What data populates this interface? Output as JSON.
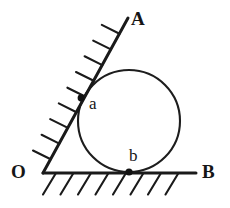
{
  "figure": {
    "background_color": "#ffffff",
    "stroke_color": "#1a1a1a",
    "labels": {
      "vertex": "O",
      "ray_upper_end": "A",
      "ray_lower_end": "B",
      "tangent_point_upper": "a",
      "tangent_point_lower": "b"
    },
    "geometry": {
      "vertex_point": {
        "x": 43,
        "y": 173
      },
      "ray_OA_end": {
        "x": 128,
        "y": 18
      },
      "ray_OB_end": {
        "x": 196,
        "y": 173
      },
      "circle": {
        "cx": 129,
        "cy": 121,
        "r": 51
      },
      "tangent_a": {
        "x": 81,
        "y": 98
      },
      "tangent_b": {
        "x": 129,
        "y": 172
      },
      "hatch_count_ray_OA": 9,
      "hatch_count_ray_OB": 8
    }
  }
}
